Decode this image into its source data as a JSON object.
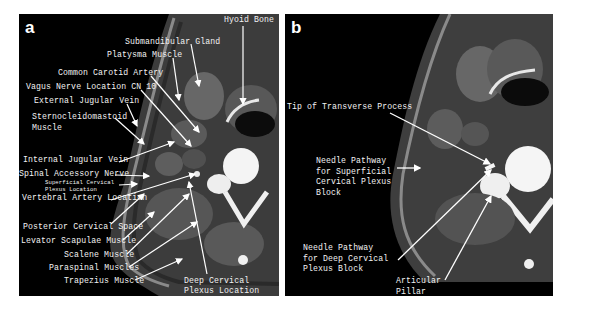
{
  "figure": {
    "panels": [
      {
        "id": "a",
        "letter": "a",
        "labels": {
          "hyoid_bone": "Hyoid Bone",
          "submandibular_gland": "Submandibular Gland",
          "platysma_muscle": "Platysma Muscle",
          "common_carotid_artery": "Common Carotid Artery",
          "vagus_nerve": "Vagus Nerve Location CN 10",
          "external_jugular_vein": "External Jugular Vein",
          "sternocleidomastoid": "Sternocleidomastoid\nMuscle",
          "internal_jugular_vein": "Internal Jugular Vein",
          "spinal_accessory_nerve": "Spinal Accessory Nerve",
          "superficial_cervical_plexus": "Superficial Cervical\nPlexus Location",
          "vertebral_artery": "Vertebral Artery Location",
          "posterior_cervical_space": "Posterior Cervical Space",
          "levator_scapulae": "Levator Scapulae Muscle",
          "scalene_muscle": "Scalene Muscle",
          "paraspinal_muscles": "Paraspinal Muscles",
          "trapezius_muscle": "Trapezius Muscle",
          "deep_cervical_plexus": "Deep Cervical\nPlexus Location"
        }
      },
      {
        "id": "b",
        "letter": "b",
        "labels": {
          "tip_transverse_process": "Tip of Transverse Process",
          "needle_superficial": "Needle Pathway\nfor Superficial\nCervical Plexus\nBlock",
          "needle_deep": "Needle Pathway\nfor Deep Cervical\nPlexus Block",
          "articular_pillar": "Articular\nPillar"
        }
      }
    ],
    "colors": {
      "background": "#000000",
      "label": "#f2f2f2",
      "page": "#ffffff"
    }
  }
}
